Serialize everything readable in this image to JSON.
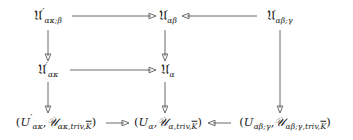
{
  "diagram": {
    "type": "commutative-diagram",
    "background_color": "#ffffff",
    "ink_color": "#1a1a1a",
    "arrow_color": "#5a5a5a",
    "rows": 3,
    "columns": 3,
    "nodes": [
      {
        "id": "top-left",
        "row": 0,
        "col": 0,
        "x": 48,
        "y": 16,
        "latex": "\\mathfrak{U}'_{\\alpha\\kappa;\\beta}",
        "base": "ℒ",
        "parts": {
          "symbol": "𝔘",
          "prime": "′",
          "subscript": "ακ;β"
        }
      },
      {
        "id": "top-middle",
        "row": 0,
        "col": 1,
        "x": 168,
        "y": 16,
        "latex": "\\mathfrak{U}_{\\alpha\\beta}",
        "parts": {
          "symbol": "𝔘",
          "prime": "",
          "subscript": "αβ"
        }
      },
      {
        "id": "top-right",
        "row": 0,
        "col": 2,
        "x": 280,
        "y": 16,
        "latex": "\\mathfrak{U}_{\\alpha\\beta;\\gamma}",
        "parts": {
          "symbol": "𝔘",
          "prime": "",
          "subscript": "αβ;γ"
        }
      },
      {
        "id": "mid-left",
        "row": 1,
        "col": 0,
        "x": 48,
        "y": 70,
        "latex": "\\mathfrak{U}'_{\\alpha\\kappa}",
        "parts": {
          "symbol": "𝔘",
          "prime": "′",
          "subscript": "ακ"
        }
      },
      {
        "id": "mid-middle",
        "row": 1,
        "col": 1,
        "x": 168,
        "y": 70,
        "latex": "\\mathfrak{U}_{\\alpha}",
        "parts": {
          "symbol": "𝔘",
          "prime": "",
          "subscript": "α"
        }
      },
      {
        "id": "bot-left",
        "row": 2,
        "col": 0,
        "x": 56,
        "y": 122,
        "latex": "(U'_{\\alpha\\kappa},\\mathcal{U}_{\\alpha\\kappa,\\mathrm{triv},\\overline{K}})",
        "parts": {
          "open": "(",
          "u_roman": "U",
          "u_prime": "′",
          "u_sub": "ακ",
          "comma": ",",
          "script_u": "𝒰",
          "script_sub_pre": "ακ,triv,",
          "script_sub_kbar": "K",
          "close": ")"
        }
      },
      {
        "id": "bot-middle",
        "row": 2,
        "col": 1,
        "x": 168,
        "y": 122,
        "latex": "(U_{\\alpha},\\mathcal{U}_{\\alpha,\\mathrm{triv},\\overline{K}})",
        "parts": {
          "open": "(",
          "u_roman": "U",
          "u_prime": "",
          "u_sub": "α",
          "comma": ",",
          "script_u": "𝒰",
          "script_sub_pre": "α,triv,",
          "script_sub_kbar": "K",
          "close": ")"
        }
      },
      {
        "id": "bot-right",
        "row": 2,
        "col": 2,
        "x": 285,
        "y": 122,
        "latex": "(U_{\\alpha\\beta;\\gamma},\\mathcal{U}_{\\alpha\\beta;\\gamma,\\mathrm{triv},\\overline{K}})",
        "parts": {
          "open": "(",
          "u_roman": "U",
          "u_prime": "",
          "u_sub": "αβ;γ",
          "comma": ",",
          "script_u": "𝒰",
          "script_sub_pre": "αβ;γ,triv,",
          "script_sub_kbar": "K",
          "close": ")"
        }
      }
    ],
    "arrows": [
      {
        "id": "top-left-to-top-middle",
        "from": "top-left",
        "to": "top-middle",
        "direction": "right",
        "orientation": "horizontal",
        "x1": 72,
        "y1": 16,
        "x2": 155,
        "y2": 16
      },
      {
        "id": "top-right-to-top-middle",
        "from": "top-right",
        "to": "top-middle",
        "direction": "left",
        "orientation": "horizontal",
        "x1": 257,
        "y1": 16,
        "x2": 182,
        "y2": 16
      },
      {
        "id": "top-left-to-mid-left",
        "from": "top-left",
        "to": "mid-left",
        "direction": "down",
        "orientation": "vertical",
        "x1": 48,
        "y1": 30,
        "x2": 48,
        "y2": 60
      },
      {
        "id": "top-middle-to-mid-middle",
        "from": "top-middle",
        "to": "mid-middle",
        "direction": "down",
        "orientation": "vertical",
        "x1": 165,
        "y1": 30,
        "x2": 165,
        "y2": 60
      },
      {
        "id": "mid-left-to-mid-middle",
        "from": "mid-left",
        "to": "mid-middle",
        "direction": "right",
        "orientation": "horizontal",
        "x1": 70,
        "y1": 70,
        "x2": 155,
        "y2": 70
      },
      {
        "id": "mid-left-to-bot-left",
        "from": "mid-left",
        "to": "bot-left",
        "direction": "down",
        "orientation": "vertical",
        "x1": 48,
        "y1": 82,
        "x2": 48,
        "y2": 112
      },
      {
        "id": "mid-middle-to-bot-middle",
        "from": "mid-middle",
        "to": "bot-middle",
        "direction": "down",
        "orientation": "vertical",
        "x1": 165,
        "y1": 82,
        "x2": 165,
        "y2": 112
      },
      {
        "id": "top-right-to-bot-right",
        "from": "top-right",
        "to": "bot-right",
        "direction": "down",
        "orientation": "vertical",
        "x1": 280,
        "y1": 30,
        "x2": 280,
        "y2": 112
      },
      {
        "id": "bot-left-to-bot-middle",
        "from": "bot-left",
        "to": "bot-middle",
        "direction": "right",
        "orientation": "horizontal",
        "x1": 106,
        "y1": 123,
        "x2": 128,
        "y2": 123
      },
      {
        "id": "bot-right-to-bot-middle",
        "from": "bot-right",
        "to": "bot-middle",
        "direction": "left",
        "orientation": "horizontal",
        "x1": 231,
        "y1": 123,
        "x2": 209,
        "y2": 123
      }
    ]
  }
}
